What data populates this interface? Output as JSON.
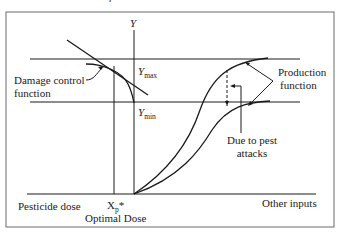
{
  "figure": {
    "top_fragment": "r",
    "y_axis_label": "Y",
    "ymax": {
      "base": "Y",
      "sub": "max"
    },
    "ymin": {
      "base": "Y",
      "sub": "min"
    },
    "damage_control_label": [
      "Damage control",
      "function"
    ],
    "production_label": [
      "Production",
      "function"
    ],
    "pest_label": [
      "Due to pest",
      "attacks"
    ],
    "x_left_label": "Pesticide dose",
    "x_right_label": "Other inputs",
    "xp": {
      "base": "X",
      "sub": "p",
      "sup": "*"
    },
    "optimal_label": "Optimal Dose",
    "colors": {
      "line": "#1a1a1a",
      "frame": "#6b6b6b",
      "background": "#ffffff"
    }
  }
}
